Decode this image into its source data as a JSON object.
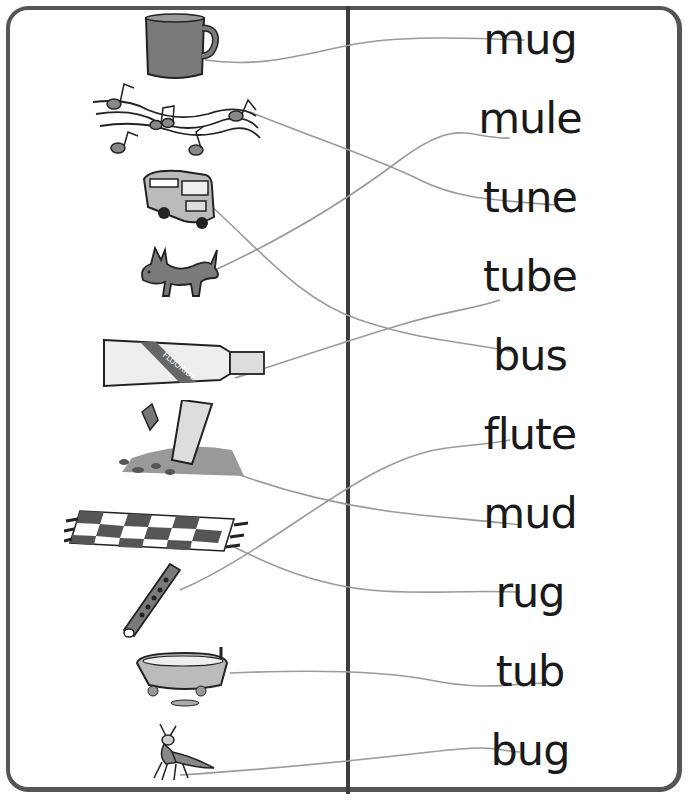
{
  "worksheet": {
    "words": [
      {
        "label": "mug",
        "top": 20
      },
      {
        "label": "mule",
        "top": 99
      },
      {
        "label": "tune",
        "top": 178
      },
      {
        "label": "tube",
        "top": 257
      },
      {
        "label": "bus",
        "top": 336
      },
      {
        "label": "flute",
        "top": 415
      },
      {
        "label": "mud",
        "top": 494
      },
      {
        "label": "rug",
        "top": 573
      },
      {
        "label": "tub",
        "top": 652
      },
      {
        "label": "bug",
        "top": 731
      }
    ],
    "pictures": [
      {
        "name": "mug-picture"
      },
      {
        "name": "music-notes-picture"
      },
      {
        "name": "bus-picture"
      },
      {
        "name": "mule-picture"
      },
      {
        "name": "toothpaste-tube-picture"
      },
      {
        "name": "mud-picture"
      },
      {
        "name": "rug-picture"
      },
      {
        "name": "flute-picture"
      },
      {
        "name": "bathtub-picture"
      },
      {
        "name": "bug-picture"
      }
    ],
    "toothpaste_label": "FLUORIDE",
    "colors": {
      "frame": "#555555",
      "divider": "#3c3c3c",
      "ink": "#1a1a1a",
      "fill_gray": "#7a7a7a",
      "pencil": "#9a9a9a"
    }
  }
}
